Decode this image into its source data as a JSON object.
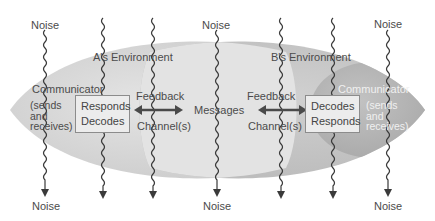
{
  "diagram": {
    "type": "transactional communication model",
    "colors": {
      "background": "#ffffff",
      "env_a_fill": "#d2d2d2",
      "env_b_fill": "#c4c4c4",
      "overlap_fill": "#e6e6e6",
      "communicator_b_fill": "#b3b3b3",
      "box_fill": "#ececec",
      "box_border": "#8c8c8c",
      "noise_line": "#3a3a3a",
      "arrow": "#4a4a4a",
      "text": "#4b4b4b"
    },
    "noise_labels": {
      "top": [
        "Noise",
        "Noise",
        "Noise"
      ],
      "bottom": [
        "Noise",
        "Noise",
        "Noise"
      ]
    },
    "environments": {
      "a": {
        "label": "A's Environment"
      },
      "b": {
        "label": "B's Environment"
      }
    },
    "communicator_a": {
      "title": "Communicator",
      "role_lines": [
        "(sends",
        "and",
        "receives)"
      ],
      "box_lines": [
        "Responds",
        "Decodes"
      ]
    },
    "communicator_b": {
      "title": "Communicator",
      "role_lines": [
        "(sends",
        "and",
        "receives)"
      ],
      "box_lines": [
        "Decodes",
        "Responds"
      ]
    },
    "center": {
      "messages": "Messages",
      "left_feedback": "Feedback",
      "left_channel": "Channel(s)",
      "right_feedback": "Feedback",
      "right_channel": "Channel(s)"
    },
    "noise_line_x": [
      45,
      103,
      153,
      217,
      281,
      333,
      388
    ]
  }
}
